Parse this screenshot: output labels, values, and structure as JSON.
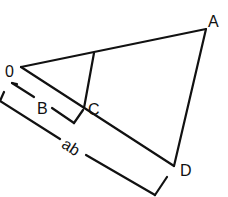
{
  "diagram": {
    "type": "geometric-construction",
    "colors": {
      "stroke": "#111111",
      "background": "#ffffff"
    },
    "points": {
      "O": {
        "label": "0",
        "x": 21,
        "y": 67
      },
      "A": {
        "label": "A",
        "x": 206,
        "y": 29
      },
      "C": {
        "label": "C",
        "x": 84,
        "y": 108
      },
      "D": {
        "label": "D",
        "x": 174,
        "y": 166
      },
      "E": {
        "label": "",
        "x": 94,
        "y": 53
      }
    },
    "segments": [
      {
        "from": "O",
        "to": "A"
      },
      {
        "from": "O",
        "to": "D"
      },
      {
        "from": "A",
        "to": "D"
      },
      {
        "from": "E",
        "to": "C"
      }
    ],
    "dimensions": [
      {
        "label": "B",
        "from": "O",
        "to": "C"
      },
      {
        "label": "ab",
        "from": "O",
        "to": "D"
      }
    ]
  }
}
